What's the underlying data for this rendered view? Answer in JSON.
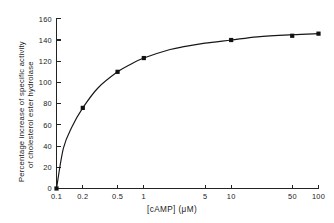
{
  "chart_data": {
    "type": "line",
    "title": "",
    "xlabel": "[cAMP] (μM)",
    "ylabel_line1": "Percentage increase of specific activity",
    "ylabel_line2": "of cholesterol ester hydrolase",
    "xscale": "log",
    "xlim": [
      0.1,
      100
    ],
    "ylim": [
      0,
      160
    ],
    "grid": false,
    "legend": false,
    "xticks": [
      0.1,
      0.2,
      0.5,
      1,
      5,
      10,
      50,
      100
    ],
    "xtick_labels": [
      "0.1",
      "0.2",
      "0.5",
      "1",
      "5",
      "10",
      "50",
      "100"
    ],
    "yticks": [
      0,
      20,
      40,
      60,
      80,
      100,
      120,
      140,
      160
    ],
    "ytick_labels": [
      "0",
      "20",
      "40",
      "60",
      "80",
      "100",
      "120",
      "140",
      "160"
    ],
    "series": [
      {
        "name": "cholesterol ester hydrolase activation",
        "marker": "filled-square",
        "x": [
          0.1,
          0.2,
          0.5,
          1,
          10,
          50,
          100
        ],
        "values": [
          0,
          76,
          110,
          123,
          140,
          144,
          146
        ]
      }
    ],
    "fitted_curve": {
      "description": "smooth saturation curve through data points",
      "x": [
        0.1,
        0.12,
        0.15,
        0.2,
        0.3,
        0.5,
        0.7,
        1,
        2,
        3,
        5,
        10,
        20,
        50,
        100
      ],
      "y": [
        0,
        38,
        58,
        76,
        95,
        110,
        117,
        123,
        131,
        134,
        137,
        140,
        143,
        145,
        146
      ]
    }
  },
  "figure": {
    "x_axis_title": "[cAMP] (μM)",
    "y_axis_title_line1": "Percentage increase of specific activity",
    "y_axis_title_line2": "of cholesterol ester hydrolase"
  }
}
